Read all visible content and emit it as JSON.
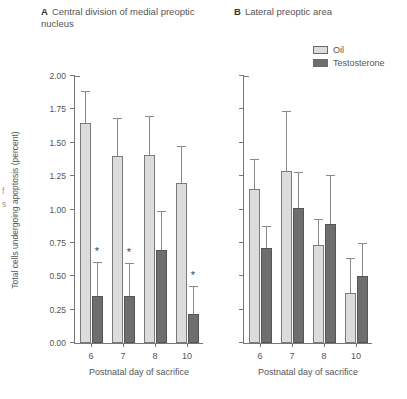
{
  "figure": {
    "panels": [
      {
        "letter": "A",
        "title": "Central division of medial preoptic nucleus"
      },
      {
        "letter": "B",
        "title": "Lateral preoptic area"
      }
    ]
  },
  "legend": {
    "position": "top-right",
    "items": [
      {
        "label": "Oil",
        "color": "#dcdcda",
        "swatch_name": "oil-swatch"
      },
      {
        "label": "Testosterone",
        "color": "#6e6e6e",
        "swatch_name": "testosterone-swatch"
      }
    ]
  },
  "axes": {
    "ylabel": "Total cells undergoing apoptosis (percent)",
    "xlabel": "Postnatal day of sacrifice",
    "yticks": [
      "0.00",
      "0.25",
      "0.50",
      "0.75",
      "1.00",
      "1.25",
      "1.50",
      "1.75",
      "2.00"
    ],
    "ytick_values": [
      0.0,
      0.25,
      0.5,
      0.75,
      1.0,
      1.25,
      1.5,
      1.75,
      2.0
    ],
    "ylim": [
      0,
      2.0
    ],
    "xticklabels": [
      "6",
      "7",
      "8",
      "10"
    ]
  },
  "chart_data": [
    {
      "type": "bar",
      "panel": "A",
      "title": "Central division of medial preoptic nucleus",
      "xlabel": "Postnatal day of sacrifice",
      "ylabel": "Total cells undergoing apoptosis (percent)",
      "ylim": [
        0,
        2.0
      ],
      "grid": false,
      "legend_position": "top-right",
      "categories": [
        "6",
        "7",
        "8",
        "10"
      ],
      "series": [
        {
          "name": "Oil",
          "color": "#dcdcda",
          "values": [
            1.65,
            1.4,
            1.41,
            1.2
          ],
          "errors_upper": [
            1.88,
            1.68,
            1.69,
            1.47
          ],
          "significance": [
            "",
            "",
            "",
            ""
          ]
        },
        {
          "name": "Testosterone",
          "color": "#6e6e6e",
          "values": [
            0.35,
            0.35,
            0.7,
            0.22
          ],
          "errors_upper": [
            0.6,
            0.59,
            0.98,
            0.42
          ],
          "significance": [
            "*",
            "*",
            "",
            "*"
          ]
        }
      ]
    },
    {
      "type": "bar",
      "panel": "B",
      "title": "Lateral preoptic area",
      "xlabel": "Postnatal day of sacrifice",
      "ylabel": "Total cells undergoing apoptosis (percent)",
      "ylim": [
        0,
        2.0
      ],
      "grid": false,
      "legend_position": "top-right",
      "categories": [
        "6",
        "7",
        "8",
        "10"
      ],
      "series": [
        {
          "name": "Oil",
          "color": "#dcdcda",
          "values": [
            1.15,
            1.29,
            0.735,
            0.375
          ],
          "errors_upper": [
            1.37,
            1.73,
            0.92,
            0.63
          ],
          "significance": [
            "",
            "",
            "",
            ""
          ]
        },
        {
          "name": "Testosterone",
          "color": "#6e6e6e",
          "values": [
            0.71,
            1.01,
            0.89,
            0.5
          ],
          "errors_upper": [
            0.87,
            1.27,
            1.25,
            0.74
          ],
          "significance": [
            "",
            "",
            "",
            ""
          ]
        }
      ]
    }
  ]
}
